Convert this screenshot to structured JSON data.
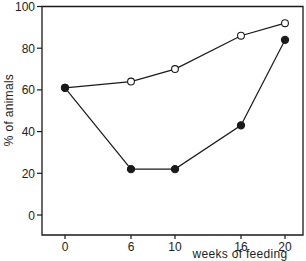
{
  "chart_data": {
    "type": "line",
    "title": "",
    "xlabel": "weeks of feeding",
    "ylabel": "% of animals",
    "x": [
      0,
      6,
      10,
      16,
      20
    ],
    "x_ticks": [
      "0",
      "6",
      "10",
      "16",
      "20"
    ],
    "y_ticks": [
      "0",
      "20",
      "40",
      "60",
      "80",
      "100"
    ],
    "ylim": [
      -9,
      100
    ],
    "xlim": [
      -2,
      21.5
    ],
    "grid": false,
    "legend": null,
    "series": [
      {
        "name": "open circles",
        "marker": "open-circle",
        "values": [
          61,
          64,
          70,
          86,
          92
        ]
      },
      {
        "name": "filled circles",
        "marker": "filled-circle",
        "values": [
          61,
          22,
          22,
          43,
          84
        ]
      }
    ]
  },
  "colors": {
    "line": "#1a1a1a",
    "background": "#ffffff"
  }
}
